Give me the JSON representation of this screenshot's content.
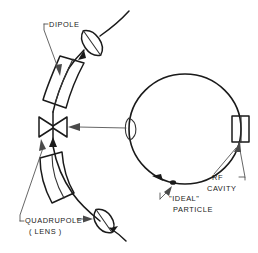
{
  "diagram": {
    "background_color": "#ffffff",
    "ink_color": "#1a1a1a",
    "leader_color": "#4a4a4a",
    "labels": {
      "dipole": "DIPOLE",
      "quadrupole": "QUADRUPOLE",
      "quadrupole_sub": "( LENS )",
      "rf_cavity_line1": "RF",
      "rf_cavity_line2": "CAVITY",
      "ideal_particle_line1": "\"IDEAL\"",
      "ideal_particle_line2": "PARTICLE"
    },
    "components": {
      "ring": {
        "name": "storage-ring",
        "center_x": 185,
        "center_y": 129,
        "radius_x": 56,
        "radius_y": 55
      },
      "rf_cavity": {
        "name": "rf-cavity",
        "x": 232,
        "y": 116,
        "width": 17,
        "height": 26
      },
      "ideal_particle": {
        "name": "ideal-particle-marker",
        "x": 173,
        "y": 182
      },
      "dipoles": [
        {
          "name": "dipole-upper",
          "label": "DIPOLE"
        },
        {
          "name": "dipole-lower",
          "label": "DIPOLE"
        }
      ],
      "quadrupoles": [
        {
          "name": "quadrupole-bowtie",
          "shape": "bowtie"
        },
        {
          "name": "quadrupole-lens-upper",
          "shape": "lens"
        },
        {
          "name": "quadrupole-lens-lower",
          "shape": "lens"
        },
        {
          "name": "quadrupole-lens-on-ring",
          "shape": "lens"
        }
      ]
    }
  }
}
